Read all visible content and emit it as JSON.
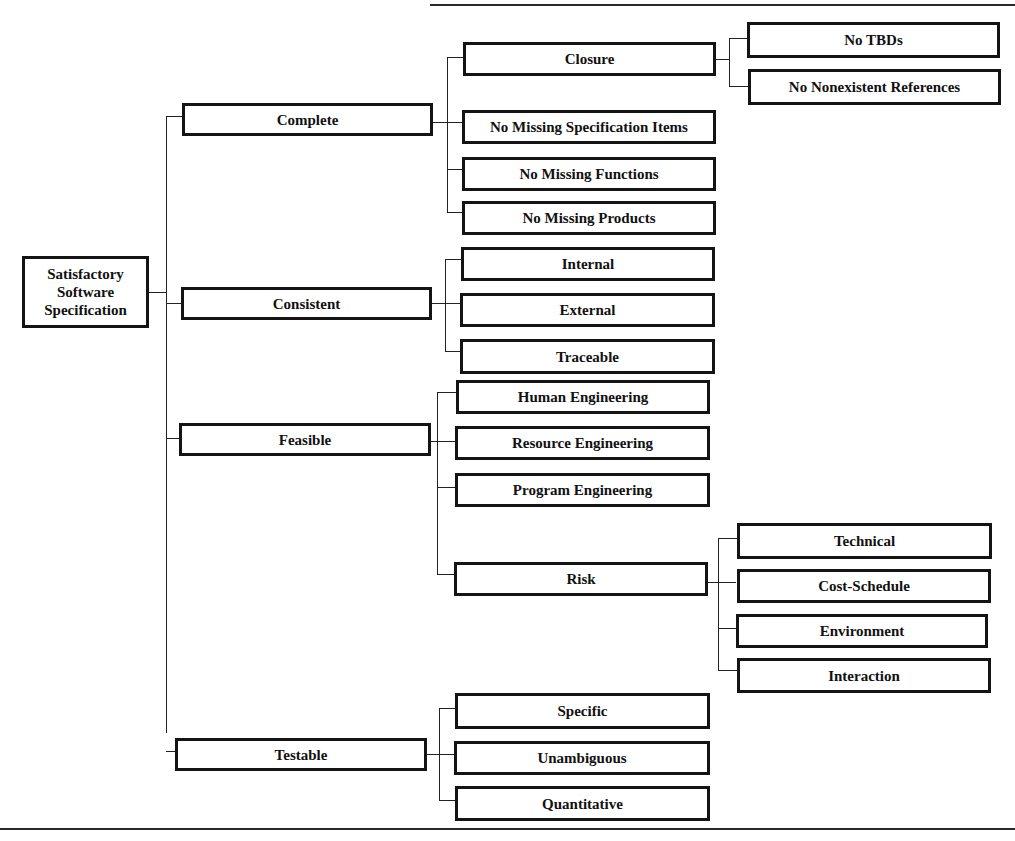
{
  "diagram": {
    "root": {
      "label": "Satisfactory Software Specification",
      "lines": [
        "Satisfactory",
        "Software",
        "Specification"
      ]
    },
    "level2": [
      {
        "label": "Complete"
      },
      {
        "label": "Consistent"
      },
      {
        "label": "Feasible"
      },
      {
        "label": "Testable"
      }
    ],
    "complete_children": [
      {
        "label": "Closure"
      },
      {
        "label": "No Missing Specification Items"
      },
      {
        "label": "No Missing Functions"
      },
      {
        "label": "No Missing Products"
      }
    ],
    "closure_children": [
      {
        "label": "No TBDs"
      },
      {
        "label": "No Nonexistent References"
      }
    ],
    "consistent_children": [
      {
        "label": "Internal"
      },
      {
        "label": "External"
      },
      {
        "label": "Traceable"
      }
    ],
    "feasible_children": [
      {
        "label": "Human Engineering"
      },
      {
        "label": "Resource Engineering"
      },
      {
        "label": "Program Engineering"
      },
      {
        "label": "Risk"
      }
    ],
    "risk_children": [
      {
        "label": "Technical"
      },
      {
        "label": "Cost-Schedule"
      },
      {
        "label": "Environment"
      },
      {
        "label": "Interaction"
      }
    ],
    "testable_children": [
      {
        "label": "Specific"
      },
      {
        "label": "Unambiguous"
      },
      {
        "label": "Quantitative"
      }
    ],
    "colors": {
      "line": "#141414",
      "background": "#ffffff"
    }
  }
}
